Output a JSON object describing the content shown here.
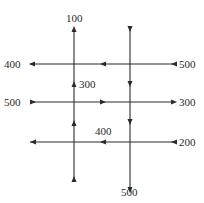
{
  "diagram": {
    "type": "traffic-flow-network",
    "roads": {
      "horizontal": [
        {
          "id": "h1",
          "left_value": "400",
          "right_value": "500",
          "direction": "west"
        },
        {
          "id": "h2",
          "left_value": "500",
          "right_value": "300",
          "direction": "east"
        },
        {
          "id": "h3",
          "left_value": "",
          "right_value": "200",
          "direction": "west"
        }
      ],
      "vertical": [
        {
          "id": "v1",
          "top_value": "100",
          "bottom_value": "",
          "direction": "north"
        },
        {
          "id": "v2",
          "top_value": "",
          "bottom_value": "500",
          "direction": "south"
        }
      ]
    },
    "internal_labels": [
      {
        "id": "mid-v1-upper",
        "value": "300"
      },
      {
        "id": "mid-h3",
        "value": "400"
      }
    ]
  },
  "labels": {
    "v1_top": "100",
    "h1_left": "400",
    "h1_right": "500",
    "v1_mid": "300",
    "h2_left": "500",
    "h2_right": "300",
    "h3_mid": "400",
    "h3_right": "200",
    "v2_bottom": "500"
  }
}
